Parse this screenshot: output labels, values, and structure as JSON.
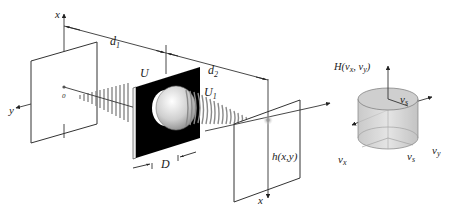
{
  "diagram": {
    "labels": {
      "x_top": "x",
      "y_left": "y",
      "origin": "0",
      "d1": "d",
      "d1_sub": "1",
      "d2": "d",
      "d2_sub": "2",
      "U": "U",
      "U1": "U",
      "U1_sub": "1",
      "D": "D",
      "h": "h(x,y)",
      "x_bottom": "x",
      "y_right": "y"
    },
    "transfer_function": {
      "H": "H(ν",
      "H_x_sub": "x",
      "H_mid": ", ν",
      "H_y_sub": "y",
      "H_close": ")",
      "nu_s_top": "ν",
      "nu_s_top_sub": "s",
      "nu_s_bottom": "ν",
      "nu_s_bottom_sub": "s",
      "nu_x": "ν",
      "nu_x_sub": "x",
      "nu_y": "ν",
      "nu_y_sub": "y"
    },
    "colors": {
      "line": "#333333",
      "aperture": "#000000",
      "cylinder_fill": "#d4d4d4",
      "wave": "#8a8a8a"
    }
  }
}
